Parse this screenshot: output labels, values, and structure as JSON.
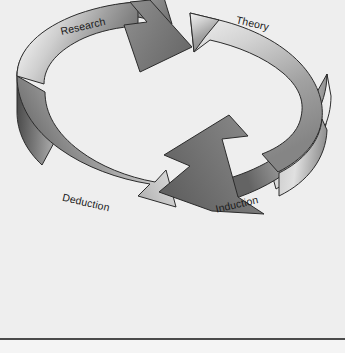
{
  "page": {
    "background_color": "#eeeeee",
    "width": 345,
    "height": 353
  },
  "diagram": {
    "type": "cyclical-process",
    "title": "",
    "rule_color": "#4a4a4a",
    "labels": [
      {
        "id": "research",
        "text": "Research",
        "position": "top-left",
        "rotation_deg": -13
      },
      {
        "id": "theory",
        "text": "Theory",
        "position": "top-right",
        "rotation_deg": 13
      },
      {
        "id": "deduction",
        "text": "Deduction",
        "position": "bottom-left",
        "rotation_deg": 13
      },
      {
        "id": "induction",
        "text": "Induction",
        "position": "bottom-right",
        "rotation_deg": -13
      }
    ],
    "arrows": [
      {
        "id": "upper-arrow",
        "from": "Research",
        "to": "Theory",
        "direction": "left-to-right",
        "gradient_from": "#fbfbfb",
        "gradient_to": "#6e6e6e",
        "stroke": "#2b2b2b"
      },
      {
        "id": "lower-arrow",
        "from": "Induction",
        "to": "Deduction",
        "direction": "right-to-left",
        "gradient_from": "#fbfbfb",
        "gradient_to": "#6e6e6e",
        "stroke": "#2b2b2b"
      }
    ],
    "colors": {
      "highlight": "#fbfbfb",
      "midtone": "#a8a8a8",
      "shadow": "#5e5e5e",
      "outline": "#2b2b2b",
      "band_dark": "#555555",
      "text": "#1a1a1a"
    }
  }
}
